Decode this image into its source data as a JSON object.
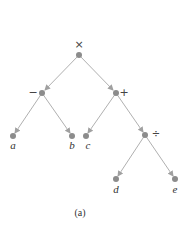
{
  "diagram": {
    "type": "expression-tree",
    "caption": "(a)",
    "colors": {
      "edge": "#b0b0b0",
      "node": "#8c8c8c",
      "text": "#333333"
    },
    "nodes": [
      {
        "id": "root",
        "label": "×",
        "x": 79,
        "y": 55
      },
      {
        "id": "minus",
        "label": "−",
        "x": 42,
        "y": 93
      },
      {
        "id": "plus",
        "label": "+",
        "x": 116,
        "y": 93
      },
      {
        "id": "a",
        "label": "a",
        "x": 13,
        "y": 136
      },
      {
        "id": "b",
        "label": "b",
        "x": 72,
        "y": 136
      },
      {
        "id": "c",
        "label": "c",
        "x": 86,
        "y": 136
      },
      {
        "id": "div",
        "label": "÷",
        "x": 145,
        "y": 135
      },
      {
        "id": "d",
        "label": "d",
        "x": 116,
        "y": 179
      },
      {
        "id": "e",
        "label": "e",
        "x": 175,
        "y": 179
      }
    ],
    "edges": [
      [
        "root",
        "minus"
      ],
      [
        "root",
        "plus"
      ],
      [
        "minus",
        "a"
      ],
      [
        "minus",
        "b"
      ],
      [
        "plus",
        "c"
      ],
      [
        "plus",
        "div"
      ],
      [
        "div",
        "d"
      ],
      [
        "div",
        "e"
      ]
    ]
  }
}
